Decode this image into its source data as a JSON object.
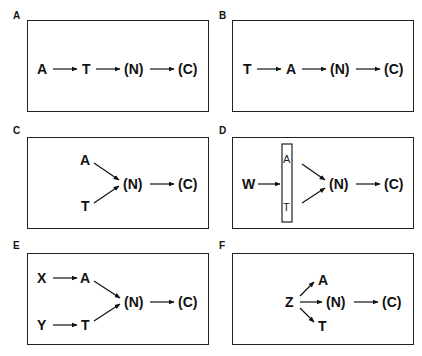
{
  "panels": [
    {
      "label": "A",
      "nodes": [
        "A",
        "T",
        "(N)",
        "(C)"
      ],
      "edges": [
        [
          "A",
          "T"
        ],
        [
          "T",
          "(N)"
        ],
        [
          "(N)",
          "(C)"
        ]
      ]
    },
    {
      "label": "B",
      "nodes": [
        "T",
        "A",
        "(N)",
        "(C)"
      ],
      "edges": [
        [
          "T",
          "A"
        ],
        [
          "A",
          "(N)"
        ],
        [
          "(N)",
          "(C)"
        ]
      ]
    },
    {
      "label": "C",
      "nodes": [
        "A",
        "T",
        "(N)",
        "(C)"
      ],
      "edges": [
        [
          "A",
          "(N)"
        ],
        [
          "T",
          "(N)"
        ],
        [
          "(N)",
          "(C)"
        ]
      ]
    },
    {
      "label": "D",
      "nodes": [
        "W",
        "A",
        "T",
        "(N)",
        "(C)"
      ],
      "edges": [
        [
          "W",
          "[A|T]"
        ],
        [
          "A",
          "(N)"
        ],
        [
          "T",
          "(N)"
        ],
        [
          "(N)",
          "(C)"
        ]
      ]
    },
    {
      "label": "E",
      "nodes": [
        "X",
        "A",
        "Y",
        "T",
        "(N)",
        "(C)"
      ],
      "edges": [
        [
          "X",
          "A"
        ],
        [
          "Y",
          "T"
        ],
        [
          "A",
          "(N)"
        ],
        [
          "T",
          "(N)"
        ],
        [
          "(N)",
          "(C)"
        ]
      ]
    },
    {
      "label": "F",
      "nodes": [
        "Z",
        "A",
        "(N)",
        "T",
        "(C)"
      ],
      "edges": [
        [
          "Z",
          "A"
        ],
        [
          "Z",
          "(N)"
        ],
        [
          "Z",
          "T"
        ],
        [
          "(N)",
          "(C)"
        ]
      ]
    }
  ]
}
